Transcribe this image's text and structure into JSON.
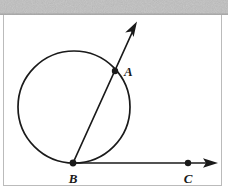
{
  "figure": {
    "background_color": "#ffffff",
    "stroke_color": "#1a1a1a",
    "scan_band_color": "#b9b9b9",
    "border_color": "#b0b0b0",
    "canvas": {
      "width": 228,
      "height": 196
    },
    "scan_band": {
      "x": 0,
      "y": 0,
      "width": 228,
      "height": 15
    },
    "frame": {
      "left": 3,
      "top": 15,
      "right": 222,
      "bottom": 186
    },
    "circle": {
      "label": "circle",
      "cx": 74,
      "cy": 107,
      "r": 56,
      "stroke_width": 1.7
    },
    "points": [
      {
        "name": "A",
        "label": "A",
        "x": 115,
        "y": 71,
        "dot_r": 3.2,
        "label_x": 124,
        "label_y": 69,
        "description": "intersection of secant ray with circle"
      },
      {
        "name": "B",
        "label": "B",
        "x": 73,
        "y": 163,
        "dot_r": 3.4,
        "label_x": 69,
        "label_y": 181,
        "description": "point of tangency at bottom of circle, common endpoint of both rays"
      },
      {
        "name": "C",
        "label": "C",
        "x": 188,
        "y": 163,
        "dot_r": 3.2,
        "label_x": 184,
        "label_y": 181,
        "description": "point on tangent ray right of B"
      }
    ],
    "rays": [
      {
        "name": "secant-ray-BA",
        "from": "B",
        "through": "A",
        "x1": 73,
        "y1": 163,
        "x2": 133,
        "y2": 30,
        "arrow_tip_x": 137,
        "arrow_tip_y": 22,
        "stroke_width": 1.7,
        "arrowhead": true
      },
      {
        "name": "tangent-ray-BC",
        "from": "B",
        "through": "C",
        "x1": 73,
        "y1": 163,
        "x2": 208,
        "y2": 163,
        "arrow_tip_x": 218,
        "arrow_tip_y": 163,
        "stroke_width": 1.7,
        "arrowhead": true
      }
    ]
  }
}
